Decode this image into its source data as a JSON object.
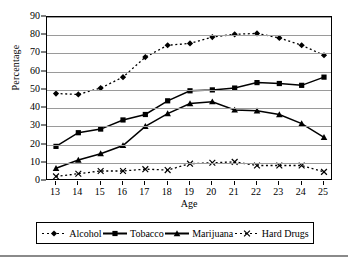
{
  "chart_data": {
    "type": "line",
    "title": "",
    "xlabel": "Age",
    "ylabel": "Percentage",
    "x": [
      13,
      14,
      15,
      16,
      17,
      18,
      19,
      20,
      21,
      22,
      23,
      24,
      25
    ],
    "categories": [
      "13",
      "14",
      "15",
      "16",
      "17",
      "18",
      "19",
      "20",
      "21",
      "22",
      "23",
      "24",
      "25"
    ],
    "xlim": [
      13,
      25
    ],
    "ylim": [
      0,
      90
    ],
    "y_ticks": [
      0,
      10,
      20,
      30,
      40,
      50,
      60,
      70,
      80,
      90
    ],
    "x_ticks": [
      13,
      14,
      15,
      16,
      17,
      18,
      19,
      20,
      21,
      22,
      23,
      24,
      25
    ],
    "grid": "horizontal",
    "legend_position": "bottom",
    "series": [
      {
        "name": "Alcohol",
        "marker": "diamond",
        "linestyle": "dashed",
        "color": "#000000",
        "values": [
          48,
          47.5,
          51,
          57,
          68,
          74.5,
          75.5,
          79,
          80.5,
          81,
          78.5,
          74.5,
          69
        ]
      },
      {
        "name": "Tobacco",
        "marker": "square",
        "linestyle": "solid",
        "color": "#000000",
        "values": [
          19,
          26.5,
          28.5,
          33.5,
          36.5,
          44,
          49.5,
          50,
          51,
          54,
          53.5,
          52.5,
          57
        ]
      },
      {
        "name": "Marijuana",
        "marker": "triangle",
        "linestyle": "solid",
        "color": "#000000",
        "values": [
          7,
          11.5,
          15,
          19.5,
          30,
          37,
          42.5,
          43.5,
          39,
          38.5,
          36.5,
          31.5,
          24
        ]
      },
      {
        "name": "Hard Drugs",
        "marker": "cross",
        "linestyle": "dashed",
        "color": "#000000",
        "values": [
          2.5,
          4,
          5.5,
          5.5,
          6.5,
          6,
          9.5,
          10,
          10.5,
          8.5,
          8.5,
          8.5,
          5
        ]
      }
    ]
  },
  "axes": {
    "y_title": "Percentage",
    "x_title": "Age"
  },
  "legend": {
    "entries": [
      {
        "label": "Alcohol"
      },
      {
        "label": "Tobacco"
      },
      {
        "label": "Marijuana"
      },
      {
        "label": "Hard Drugs"
      }
    ]
  },
  "style": {
    "plot_border": "#000000",
    "gridline": "#9a9a9a",
    "series_color": "#000000",
    "background": "#ffffff"
  }
}
